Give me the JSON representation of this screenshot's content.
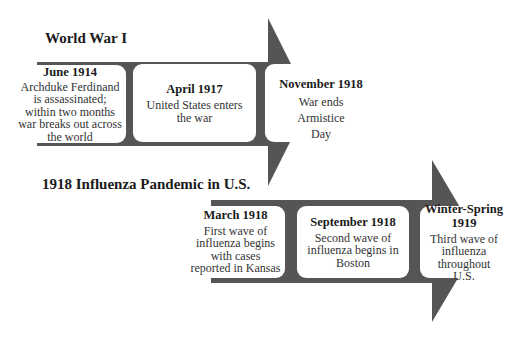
{
  "colors": {
    "arrow": "#555555",
    "box": "#ffffff",
    "background": "#ffffff"
  },
  "timelines": [
    {
      "title": "World War I",
      "events": [
        {
          "date": "June 1914",
          "description": "Archduke Ferdinand is assassinated; within two months war breaks out across the world"
        },
        {
          "date": "April 1917",
          "description": "United States enters the war"
        },
        {
          "date": "November 1918",
          "description": "War ends Armistice Day"
        }
      ]
    },
    {
      "title": "1918 Influenza Pandemic in U.S.",
      "events": [
        {
          "date": "March 1918",
          "description": "First wave of influenza begins with cases reported in Kansas"
        },
        {
          "date": "September 1918",
          "description": "Second wave of influenza begins in Boston"
        },
        {
          "date": "Winter-Spring 1919",
          "description": "Third wave of influenza throughout U.S."
        }
      ]
    }
  ]
}
